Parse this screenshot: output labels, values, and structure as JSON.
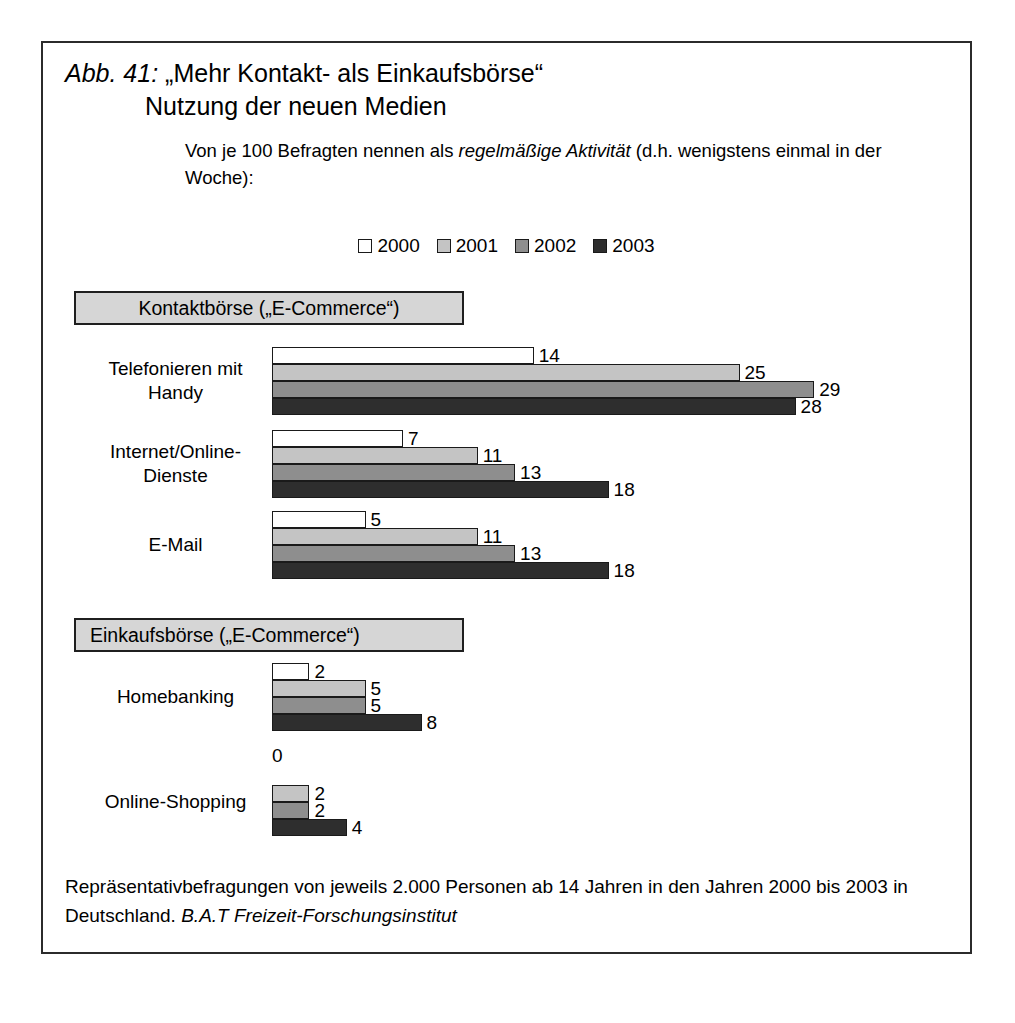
{
  "figure": {
    "number_label": "Abb. 41:",
    "title_line1": "„Mehr Kontakt- als Einkaufsbörse“",
    "title_line2": "Nutzung der neuen Medien",
    "subtitle_part1": "Von je 100 Befragten nennen als ",
    "subtitle_italic": "regelmäßige Aktivität",
    "subtitle_part2": " (d.h. wenigstens einmal in der Woche):",
    "source_text": "Repräsentativbefragungen von jeweils 2.000 Personen ab 14 Jahren in den Jahren 2000 bis 2003 in Deutschland. ",
    "source_italic": "B.A.T Freizeit-Forschungsinstitut"
  },
  "sections": {
    "contact": "Kontaktbörse („E-Commerce“)",
    "purchase": "Einkaufsbörse („E-Commerce“)"
  },
  "legend": [
    {
      "label": "2000",
      "color": "#ffffff"
    },
    {
      "label": "2001",
      "color": "#c4c4c4"
    },
    {
      "label": "2002",
      "color": "#8e8e8e"
    },
    {
      "label": "2003",
      "color": "#2e2e2e"
    }
  ],
  "groups": [
    {
      "label_line1": "Telefonieren mit",
      "label_line2": "Handy",
      "values": [
        14,
        25,
        29,
        28
      ],
      "value_labels": [
        "14",
        "25",
        "29",
        "28"
      ]
    },
    {
      "label_line1": "Internet/Online-",
      "label_line2": "Dienste",
      "values": [
        7,
        11,
        13,
        18
      ],
      "value_labels": [
        "7",
        "11",
        "13",
        "18"
      ]
    },
    {
      "label_line1": "E-Mail",
      "label_line2": "",
      "values": [
        5,
        11,
        13,
        18
      ],
      "value_labels": [
        "5",
        "11",
        "13",
        "18"
      ]
    },
    {
      "label_line1": "Homebanking",
      "label_line2": "",
      "values": [
        2,
        5,
        5,
        8
      ],
      "value_labels": [
        "2",
        "5",
        "5",
        "8"
      ]
    },
    {
      "label_line1": "Online-Shopping",
      "label_line2": "",
      "values": [
        0,
        2,
        2,
        4
      ],
      "value_labels": [
        "0",
        "2",
        "2",
        "4"
      ]
    }
  ],
  "chart_data": {
    "type": "bar",
    "orientation": "horizontal",
    "title": "„Mehr Kontakt- als Einkaufsbörse“ Nutzung der neuen Medien",
    "subtitle": "Von je 100 Befragten nennen als regelmäßige Aktivität (d.h. wenigstens einmal in der Woche):",
    "categories": [
      "Telefonieren mit Handy",
      "Internet/Online-Dienste",
      "E-Mail",
      "Homebanking",
      "Online-Shopping"
    ],
    "series": [
      {
        "name": "2000",
        "color": "#ffffff",
        "values": [
          14,
          7,
          5,
          2,
          0
        ]
      },
      {
        "name": "2001",
        "color": "#c4c4c4",
        "values": [
          25,
          11,
          11,
          5,
          2
        ]
      },
      {
        "name": "2002",
        "color": "#8e8e8e",
        "values": [
          29,
          13,
          13,
          5,
          2
        ]
      },
      {
        "name": "2003",
        "color": "#2e2e2e",
        "values": [
          28,
          18,
          18,
          8,
          4
        ]
      }
    ],
    "group_headings": {
      "Kontaktbörse („E-Commerce“)": [
        "Telefonieren mit Handy",
        "Internet/Online-Dienste",
        "E-Mail"
      ],
      "Einkaufsbörse („E-Commerce“)": [
        "Homebanking",
        "Online-Shopping"
      ]
    },
    "xlabel": "",
    "ylabel": "",
    "xlim": [
      0,
      29
    ],
    "grid": false,
    "legend_position": "top-center",
    "data_labels": true,
    "unit": "von je 100 Befragten",
    "source": "Repräsentativbefragungen von jeweils 2.000 Personen ab 14 Jahren in den Jahren 2000 bis 2003 in Deutschland. B.A.T Freizeit-Forschungsinstitut"
  }
}
